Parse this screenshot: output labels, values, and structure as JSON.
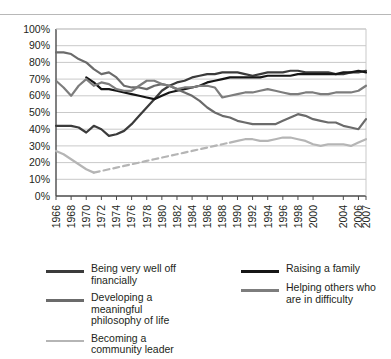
{
  "chart_data": {
    "type": "line",
    "title": "",
    "subtitle": "",
    "xlabel": "",
    "ylabel": "",
    "xlim": [
      1966,
      2007
    ],
    "ylim": [
      0,
      100
    ],
    "grid": true,
    "legend_position": "bottom",
    "y_ticks": [
      "0%",
      "10%",
      "20%",
      "30%",
      "40%",
      "50%",
      "60%",
      "70%",
      "80%",
      "90%",
      "100%"
    ],
    "y_tick_values": [
      0,
      10,
      20,
      30,
      40,
      50,
      60,
      70,
      80,
      90,
      100
    ],
    "x_ticks": [
      "1966",
      "1968",
      "1970",
      "1972",
      "1974",
      "1976",
      "1978",
      "1980",
      "1982",
      "1984",
      "1986",
      "1988",
      "1990",
      "1992",
      "1994",
      "1996",
      "1998",
      "2000",
      "2004",
      "2006",
      "2007"
    ],
    "x_tick_values": [
      1966,
      1968,
      1970,
      1972,
      1974,
      1976,
      1978,
      1980,
      1982,
      1984,
      1986,
      1988,
      1990,
      1992,
      1994,
      1996,
      1998,
      2000,
      2004,
      2006,
      2007
    ],
    "series": [
      {
        "name": "Being very well off financially",
        "color": "#3b3b3b",
        "style": "solid",
        "width": 2.2,
        "x": [
          1966,
          1967,
          1968,
          1969,
          1970,
          1971,
          1972,
          1973,
          1974,
          1975,
          1976,
          1977,
          1978,
          1979,
          1980,
          1981,
          1982,
          1983,
          1984,
          1985,
          1986,
          1987,
          1988,
          1989,
          1990,
          1991,
          1992,
          1993,
          1994,
          1995,
          1996,
          1997,
          1998,
          1999,
          2000,
          2001,
          2002,
          2003,
          2004,
          2005,
          2006,
          2007
        ],
        "values": [
          42,
          42,
          42,
          41,
          38,
          42,
          40,
          36,
          37,
          39,
          43,
          48,
          53,
          58,
          63,
          66,
          68,
          69,
          71,
          72,
          73,
          73,
          74,
          74,
          74,
          73,
          72,
          73,
          74,
          74,
          74,
          75,
          75,
          74,
          74,
          74,
          74,
          73,
          73,
          74,
          74,
          75
        ]
      },
      {
        "name": "Raising a family",
        "color": "#161616",
        "style": "solid",
        "width": 2.2,
        "x": [
          1970,
          1971,
          1972,
          1973,
          1974,
          1975,
          1976,
          1977,
          1978,
          1979,
          1980,
          1981,
          1982,
          1983,
          1984,
          1985,
          1986,
          1987,
          1988,
          1989,
          1990,
          1991,
          1992,
          1993,
          1994,
          1995,
          1996,
          1997,
          1998,
          1999,
          2000,
          2001,
          2002,
          2003,
          2004,
          2005,
          2006,
          2007
        ],
        "values": [
          71,
          68,
          64,
          64,
          63,
          62,
          61,
          60,
          59,
          58,
          60,
          62,
          63,
          64,
          65,
          66,
          68,
          69,
          70,
          71,
          71,
          71,
          71,
          71,
          72,
          72,
          72,
          72,
          73,
          73,
          73,
          73,
          73,
          73,
          74,
          74,
          75,
          74
        ]
      },
      {
        "name": "Developing a meaningful philosophy of life",
        "color": "#6b6b6b",
        "style": "solid",
        "width": 2.2,
        "x": [
          1966,
          1967,
          1968,
          1969,
          1970,
          1971,
          1972,
          1973,
          1974,
          1975,
          1976,
          1977,
          1978,
          1979,
          1980,
          1981,
          1982,
          1983,
          1984,
          1985,
          1986,
          1987,
          1988,
          1989,
          1990,
          1991,
          1992,
          1993,
          1994,
          1995,
          1996,
          1997,
          1998,
          1999,
          2000,
          2001,
          2002,
          2003,
          2004,
          2005,
          2006,
          2007
        ],
        "values": [
          86,
          86,
          85,
          82,
          80,
          76,
          73,
          74,
          71,
          66,
          65,
          65,
          64,
          66,
          67,
          66,
          64,
          62,
          60,
          57,
          53,
          50,
          48,
          47,
          45,
          44,
          43,
          43,
          43,
          43,
          45,
          47,
          49,
          48,
          46,
          45,
          44,
          44,
          42,
          41,
          40,
          46
        ]
      },
      {
        "name": "Helping others who are in difficulty",
        "color": "#7d7d7d",
        "style": "solid",
        "width": 2.2,
        "x": [
          1966,
          1967,
          1968,
          1969,
          1970,
          1971,
          1972,
          1973,
          1974,
          1975,
          1976,
          1977,
          1978,
          1979,
          1980,
          1981,
          1982,
          1983,
          1984,
          1985,
          1986,
          1987,
          1988,
          1989,
          1990,
          1991,
          1992,
          1993,
          1994,
          1995,
          1996,
          1997,
          1998,
          1999,
          2000,
          2001,
          2002,
          2003,
          2004,
          2005,
          2006,
          2007
        ],
        "values": [
          69,
          65,
          60,
          66,
          70,
          66,
          68,
          67,
          64,
          63,
          63,
          66,
          69,
          69,
          67,
          66,
          64,
          65,
          65,
          66,
          66,
          65,
          59,
          60,
          61,
          62,
          62,
          63,
          64,
          63,
          62,
          61,
          61,
          62,
          62,
          61,
          61,
          62,
          62,
          62,
          63,
          66
        ]
      },
      {
        "name": "Becoming a community leader",
        "color": "#b5b5b5",
        "style": "solid-dashed-solid",
        "dash_range": [
          1971,
          1989
        ],
        "width": 2.2,
        "x": [
          1966,
          1967,
          1968,
          1969,
          1970,
          1971,
          1972,
          1973,
          1974,
          1975,
          1976,
          1977,
          1978,
          1979,
          1980,
          1981,
          1982,
          1983,
          1984,
          1985,
          1986,
          1987,
          1988,
          1989,
          1990,
          1991,
          1992,
          1993,
          1994,
          1995,
          1996,
          1997,
          1998,
          1999,
          2000,
          2001,
          2002,
          2003,
          2004,
          2005,
          2006,
          2007
        ],
        "values": [
          27,
          25,
          22,
          19,
          16,
          14,
          15,
          16,
          17,
          18,
          19,
          20,
          21,
          22,
          23,
          24,
          25,
          26,
          27,
          28,
          29,
          30,
          31,
          32,
          33,
          34,
          34,
          33,
          33,
          34,
          35,
          35,
          34,
          33,
          31,
          30,
          31,
          31,
          31,
          30,
          32,
          34
        ]
      }
    ]
  },
  "legend": {
    "left_entries": [
      {
        "label": "Being very well off financially",
        "color": "#3b3b3b",
        "style": "solid"
      },
      {
        "label": "Developing a meaningful\nphilosophy of life",
        "color": "#6b6b6b",
        "style": "solid"
      },
      {
        "label": "Becoming a community leader",
        "color": "#b5b5b5",
        "style": "solid"
      }
    ],
    "right_entries": [
      {
        "label": "Raising a family",
        "color": "#161616",
        "style": "solid"
      },
      {
        "label": "Helping others who\nare in difficulty",
        "color": "#7d7d7d",
        "style": "solid"
      }
    ]
  },
  "colors": {
    "gridline": "#c9c9c9",
    "axis": "#4a4a4a",
    "text": "#231f20",
    "background": "#ffffff"
  }
}
